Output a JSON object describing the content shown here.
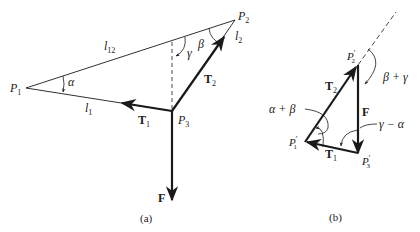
{
  "figure": {
    "panel_a": {
      "caption": "(a)",
      "points": {
        "P1": {
          "label": "P",
          "sub": "1"
        },
        "P2": {
          "label": "P",
          "sub": "2"
        },
        "P3": {
          "label": "P",
          "sub": "3"
        }
      },
      "lengths": {
        "l12": {
          "label": "l",
          "sub": "12"
        },
        "l1": {
          "label": "l",
          "sub": "1"
        },
        "l2": {
          "label": "l",
          "sub": "2"
        }
      },
      "angles": {
        "alpha": "α",
        "beta": "β",
        "gamma": "γ"
      },
      "forces": {
        "T1": {
          "label": "T",
          "sub": "1"
        },
        "T2": {
          "label": "T",
          "sub": "2"
        },
        "F": {
          "label": "F"
        }
      }
    },
    "panel_b": {
      "caption": "(b)",
      "points": {
        "P1p": {
          "label": "P",
          "sub": "1",
          "prime": "′"
        },
        "P2p": {
          "label": "P",
          "sub": "2",
          "prime": "′"
        },
        "P3p": {
          "label": "P",
          "sub": "3",
          "prime": "′"
        }
      },
      "angles": {
        "alpha_plus_beta": "α + β",
        "beta_plus_gamma": "β + γ",
        "gamma_minus_alpha": "γ − α"
      },
      "forces": {
        "T1": {
          "label": "T",
          "sub": "1"
        },
        "T2": {
          "label": "T",
          "sub": "2"
        },
        "F": {
          "label": "F"
        }
      }
    },
    "colors": {
      "ink": "#1a1a1a",
      "background": "#ffffff"
    }
  }
}
